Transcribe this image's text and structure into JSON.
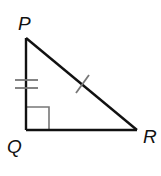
{
  "diagram": {
    "type": "right-triangle",
    "vertices": [
      {
        "id": "P",
        "label": "P",
        "x": 26,
        "y": 38
      },
      {
        "id": "Q",
        "label": "Q",
        "x": 26,
        "y": 130
      },
      {
        "id": "R",
        "label": "R",
        "x": 137,
        "y": 130
      }
    ],
    "sides": [
      {
        "id": "PQ",
        "tick_marks": 2
      },
      {
        "id": "PR",
        "tick_marks": 1
      },
      {
        "id": "QR",
        "tick_marks": 0
      }
    ],
    "right_angle_at": "Q",
    "colors": {
      "line": "#111111",
      "marks": "#777777"
    }
  }
}
